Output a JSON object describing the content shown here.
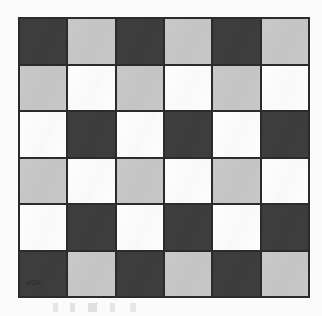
{
  "image": {
    "kind": "scanned-checkerboard-figure",
    "background_color": "#fafafa"
  },
  "board": {
    "name": "checkerboard",
    "rows": 6,
    "columns": 6,
    "gridline_color": "#2b2b2b",
    "border_color": "#2b2b2b",
    "palette": {
      "dark": "#3d3d3d",
      "light_gray": "#c8c8c8",
      "white": "#fdfdfd"
    },
    "tone_names": {
      "dark": "dark gray",
      "light_gray": "light gray",
      "white": "white"
    },
    "cells": [
      [
        "dark",
        "light_gray",
        "dark",
        "light_gray",
        "dark",
        "light_gray"
      ],
      [
        "light_gray",
        "white",
        "light_gray",
        "white",
        "light_gray",
        "white"
      ],
      [
        "white",
        "dark",
        "white",
        "dark",
        "white",
        "dark"
      ],
      [
        "light_gray",
        "white",
        "light_gray",
        "white",
        "light_gray",
        "white"
      ],
      [
        "white",
        "dark",
        "white",
        "dark",
        "white",
        "dark"
      ],
      [
        "dark",
        "light_gray",
        "dark",
        "light_gray",
        "dark",
        "light_gray"
      ]
    ],
    "artifact": {
      "name": "scan-smudge",
      "row": 6,
      "column": 1,
      "description": "faint darker squiggle mark"
    }
  }
}
